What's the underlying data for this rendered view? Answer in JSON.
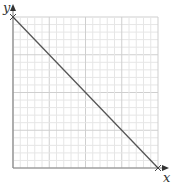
{
  "diagram": {
    "type": "coordinate-graph",
    "axes": {
      "x_label": "x",
      "y_label": "y"
    },
    "grid": {
      "minor_count": 20,
      "major_every": 5
    },
    "line": {
      "description": "straight line with negative slope crossing y-axis and x-axis",
      "y_intercept_marker": "cross",
      "x_intercept_marker": "cross"
    },
    "colors": {
      "grid_minor": "#e6e6e6",
      "grid_major": "#cfcfcf",
      "axis": "#888888",
      "line": "#555555"
    }
  }
}
